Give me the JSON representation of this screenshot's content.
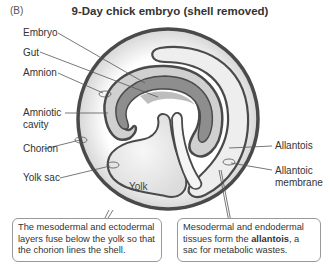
{
  "figure": {
    "panel_letter": "(B)",
    "title": "9-Day chick embryo (shell removed)"
  },
  "labels": {
    "embryo": "Embryo",
    "gut": "Gut",
    "amnion": "Amnion",
    "amniotic_cavity_line1": "Amniotic",
    "amniotic_cavity_line2": "cavity",
    "chorion": "Chorion",
    "yolk_sac": "Yolk sac",
    "yolk": "Yolk",
    "allantois": "Allantois",
    "allantoic_membrane_line1": "Allantoic",
    "allantoic_membrane_line2": "membrane"
  },
  "callouts": {
    "left": {
      "text": "The mesodermal and ectodermal layers fuse below the yolk so that the chorion lines the shell."
    },
    "right": {
      "text_before": "Mesodermal and endodermal tissues form the ",
      "bold": "allantois",
      "text_after": ", a sac for metabolic wastes."
    }
  },
  "colors": {
    "membrane_stroke": "#4a4a4a",
    "embryo_fill": "#8e8e8e",
    "cavity_fill": "#d8d8d8",
    "background": "#ffffff",
    "leader_line": "#555555"
  }
}
